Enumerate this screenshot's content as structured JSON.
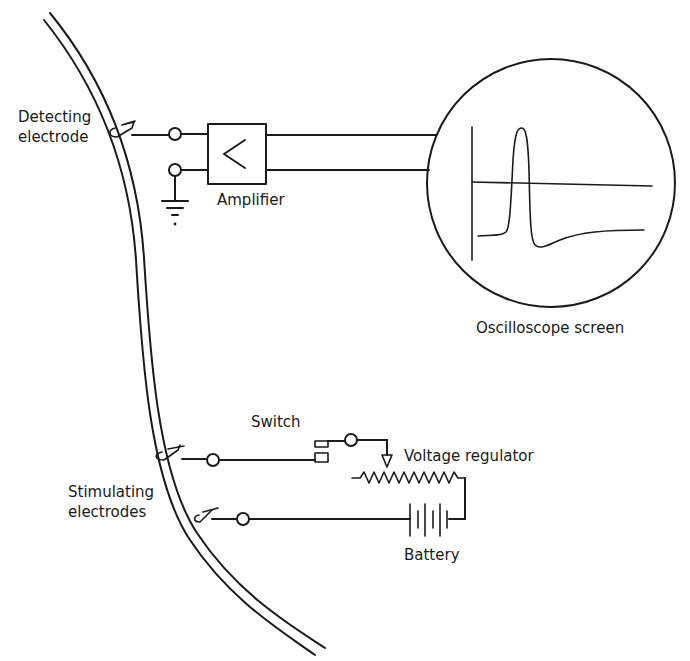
{
  "diagram": {
    "labels": {
      "detecting_electrode": "Detecting\nelectrode",
      "amplifier": "Amplifier",
      "oscilloscope_screen": "Oscilloscope screen",
      "switch": "Switch",
      "voltage_regulator": "Voltage regulator",
      "stimulating_electrodes": "Stimulating\nelectrodes",
      "battery": "Battery"
    },
    "components": [
      {
        "id": "nerve-fiber",
        "type": "nerve fiber (double curved line)"
      },
      {
        "id": "detecting-electrode",
        "type": "electrode"
      },
      {
        "id": "amplifier",
        "type": "amplifier",
        "symbol": "<"
      },
      {
        "id": "ground",
        "type": "ground"
      },
      {
        "id": "oscilloscope",
        "type": "circular screen",
        "trace": "action potential spike with undershoot"
      },
      {
        "id": "stimulating-electrode-1",
        "type": "electrode"
      },
      {
        "id": "stimulating-electrode-2",
        "type": "electrode"
      },
      {
        "id": "switch",
        "type": "switch"
      },
      {
        "id": "voltage-regulator",
        "type": "variable resistor (potentiometer)"
      },
      {
        "id": "battery",
        "type": "battery"
      }
    ],
    "colors": {
      "ink": "#1a1a1a",
      "background": "#ffffff"
    }
  }
}
